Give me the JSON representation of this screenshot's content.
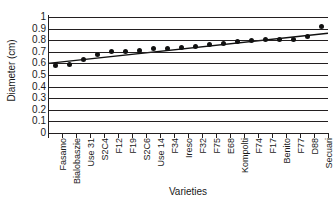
{
  "chart_data": {
    "type": "scatter",
    "title": "",
    "xlabel": "Varieties",
    "ylabel": "Diameter (cm)",
    "ylim": [
      0,
      1
    ],
    "ytick_labels": [
      "1",
      "0.9",
      "0.8",
      "0.7",
      "0.6",
      "0.5",
      "0.4",
      "0.3",
      "0.2",
      "0.1",
      "0"
    ],
    "ytick_values": [
      1,
      0.9,
      0.8,
      0.7,
      0.6,
      0.5,
      0.4,
      0.3,
      0.2,
      0.1,
      0
    ],
    "grid": true,
    "legend": "none",
    "categories": [
      "Fasamo",
      "Bialobaszie",
      "Use 31",
      "S2C4",
      "F12",
      "F19",
      "S2C6",
      "Use 14",
      "F34",
      "Ireso",
      "F32",
      "F75",
      "E68",
      "Kompolti",
      "F74",
      "F17",
      "Benito",
      "F77",
      "D88",
      "Secuari"
    ],
    "values": [
      0.585,
      0.59,
      0.635,
      0.68,
      0.7,
      0.7,
      0.715,
      0.725,
      0.725,
      0.74,
      0.75,
      0.765,
      0.775,
      0.79,
      0.8,
      0.805,
      0.81,
      0.81,
      0.835,
      0.92
    ],
    "series": [
      {
        "name": "Diameter",
        "marker": "filled-circle",
        "color": "#111111",
        "values": [
          0.585,
          0.59,
          0.635,
          0.68,
          0.7,
          0.7,
          0.715,
          0.725,
          0.725,
          0.74,
          0.75,
          0.765,
          0.775,
          0.79,
          0.8,
          0.805,
          0.81,
          0.81,
          0.835,
          0.92
        ]
      },
      {
        "name": "Linear trend",
        "marker": "none",
        "color": "#111111",
        "trendline": true,
        "start_value": 0.6,
        "end_value": 0.86
      }
    ]
  }
}
